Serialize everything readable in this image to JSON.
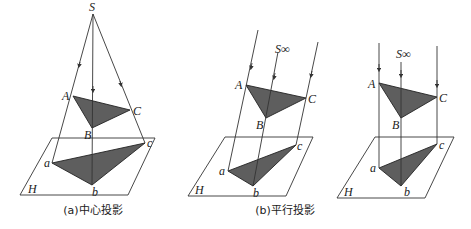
{
  "figure": {
    "colors": {
      "triangle_fill": "#5e5e5e",
      "line": "#333333",
      "background": "#ffffff"
    },
    "panels": [
      {
        "id": "central",
        "caption": "(a)中心投影",
        "labels": {
          "source": "S",
          "A": "A",
          "B": "B",
          "C": "C",
          "a": "a",
          "b": "b",
          "c": "c",
          "plane": "H"
        }
      },
      {
        "id": "oblique-parallel",
        "caption": "(b)平行投影",
        "labels": {
          "source": "S∞",
          "A": "A",
          "B": "B",
          "C": "C",
          "a": "a",
          "b": "b",
          "c": "c",
          "plane": "H"
        }
      },
      {
        "id": "orthogonal-parallel",
        "caption": "",
        "labels": {
          "source": "S∞",
          "A": "A",
          "B": "B",
          "C": "C",
          "a": "a",
          "b": "b",
          "c": "c",
          "plane": "H"
        }
      }
    ]
  }
}
